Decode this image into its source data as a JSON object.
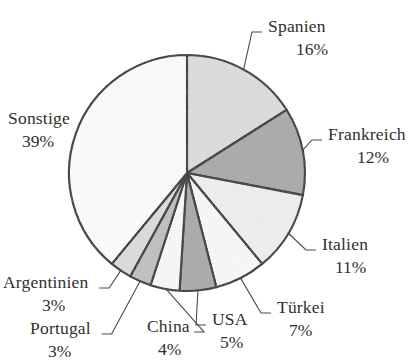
{
  "chart_data": {
    "type": "pie",
    "title": "",
    "subtitle": "",
    "xlabel": "",
    "ylabel": "",
    "legend_position": "none",
    "grid": false,
    "start_angle_deg": 0,
    "direction": "clockwise",
    "units": "%",
    "categories": [
      "Spanien",
      "Frankreich",
      "Italien",
      "Türkei",
      "USA",
      "China",
      "Portugal",
      "Argentinien",
      "Sonstige"
    ],
    "values": [
      16,
      12,
      11,
      7,
      5,
      4,
      3,
      3,
      39
    ],
    "total": 100,
    "slices": [
      {
        "name": "Spanien",
        "label": "Spanien",
        "value": 16,
        "value_label": "16%",
        "color": "#dedede",
        "label_x": 268,
        "label_y": 18,
        "pct_x": 296,
        "pct_y": 41
      },
      {
        "name": "Frankreich",
        "label": "Frankreich",
        "value": 12,
        "value_label": "12%",
        "color": "#a9a9a9",
        "label_x": 328,
        "label_y": 126,
        "pct_x": 357,
        "pct_y": 149
      },
      {
        "name": "Italien",
        "label": "Italien",
        "value": 11,
        "value_label": "11%",
        "color": "#f1f1f1",
        "label_x": 322,
        "label_y": 236,
        "pct_x": 335,
        "pct_y": 259
      },
      {
        "name": "Türkei",
        "label": "Türkei",
        "value": 7,
        "value_label": "7%",
        "color": "#fbfbfb",
        "label_x": 277,
        "label_y": 299,
        "pct_x": 289,
        "pct_y": 322
      },
      {
        "name": "USA",
        "label": "USA",
        "value": 5,
        "value_label": "5%",
        "color": "#a9a9a9",
        "label_x": 212,
        "label_y": 311,
        "pct_x": 220,
        "pct_y": 334
      },
      {
        "name": "China",
        "label": "China",
        "value": 4,
        "value_label": "4%",
        "color": "#fbfbfb",
        "label_x": 147,
        "label_y": 318,
        "pct_x": 158,
        "pct_y": 341
      },
      {
        "name": "Portugal",
        "label": "Portugal",
        "value": 3,
        "value_label": "3%",
        "color": "#c0c0c0",
        "label_x": 30,
        "label_y": 320,
        "pct_x": 48,
        "pct_y": 343
      },
      {
        "name": "Argentinien",
        "label": "Argentinien",
        "value": 3,
        "value_label": "3%",
        "color": "#dedede",
        "label_x": 3,
        "label_y": 274,
        "pct_x": 42,
        "pct_y": 297
      },
      {
        "name": "Sonstige",
        "label": "Sonstige",
        "value": 39,
        "value_label": "39%",
        "color": "#ffffff",
        "label_x": 8,
        "label_y": 110,
        "pct_x": 22,
        "pct_y": 133
      }
    ],
    "geometry": {
      "center_x": 187,
      "center_y": 173,
      "radius": 118
    },
    "style": {
      "outline_color": "#231f1f",
      "leader_color": "#4a4a4a",
      "background": "#ffffff",
      "text_color": "#303030"
    }
  }
}
